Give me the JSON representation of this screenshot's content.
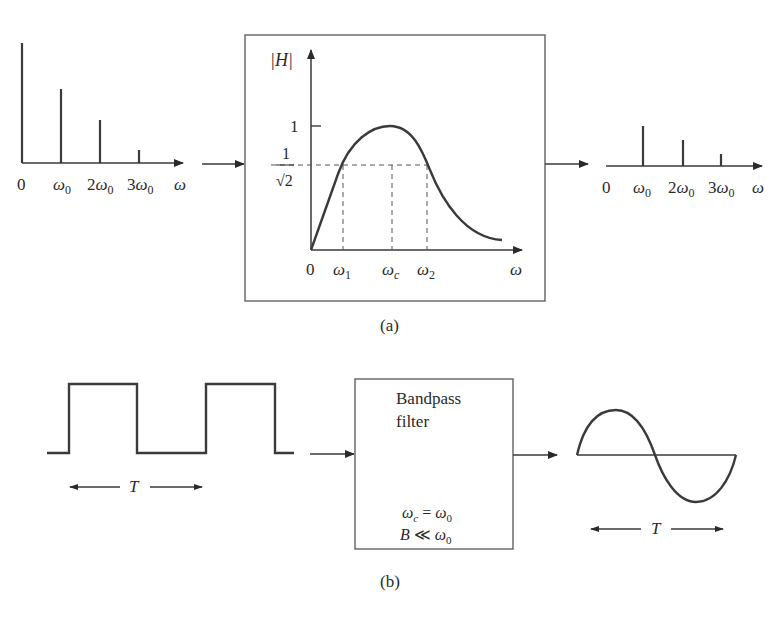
{
  "figure": {
    "part_a": {
      "caption": "(a)",
      "input_spectrum": {
        "axis_label": "ω",
        "ticks": [
          {
            "label": "0"
          },
          {
            "label": "ω",
            "sub": "0",
            "prefix": ""
          },
          {
            "label": "ω",
            "sub": "0",
            "prefix": "2"
          },
          {
            "label": "ω",
            "sub": "0",
            "prefix": "3"
          }
        ],
        "relative_heights": [
          1.0,
          0.66,
          0.38,
          0.12
        ]
      },
      "filter_response": {
        "y_label": "|H|",
        "y_tick_one": "1",
        "y_tick_half_power_num": "1",
        "y_tick_half_power_den": "√2",
        "x_label": "ω",
        "x_ticks": [
          {
            "label": "0"
          },
          {
            "label": "ω",
            "sub": "1"
          },
          {
            "label": "ω",
            "sub": "c"
          },
          {
            "label": "ω",
            "sub": "2"
          }
        ]
      },
      "output_spectrum": {
        "axis_label": "ω",
        "ticks": [
          {
            "label": "0"
          },
          {
            "label": "ω",
            "sub": "0",
            "prefix": ""
          },
          {
            "label": "ω",
            "sub": "0",
            "prefix": "2"
          },
          {
            "label": "ω",
            "sub": "0",
            "prefix": "3"
          }
        ],
        "relative_heights": [
          0,
          0.4,
          0.27,
          0.12
        ]
      }
    },
    "part_b": {
      "caption": "(b)",
      "input_label": "T",
      "filter_title_line1": "Bandpass",
      "filter_title_line2": "filter",
      "filter_cond1_lhs": "ω",
      "filter_cond1_lhs_sub": "c",
      "filter_cond1_op": " = ",
      "filter_cond1_rhs": "ω",
      "filter_cond1_rhs_sub": "0",
      "filter_cond2_lhs": "B",
      "filter_cond2_op": " ≪ ",
      "filter_cond2_rhs": "ω",
      "filter_cond2_rhs_sub": "0",
      "output_label": "T"
    }
  }
}
